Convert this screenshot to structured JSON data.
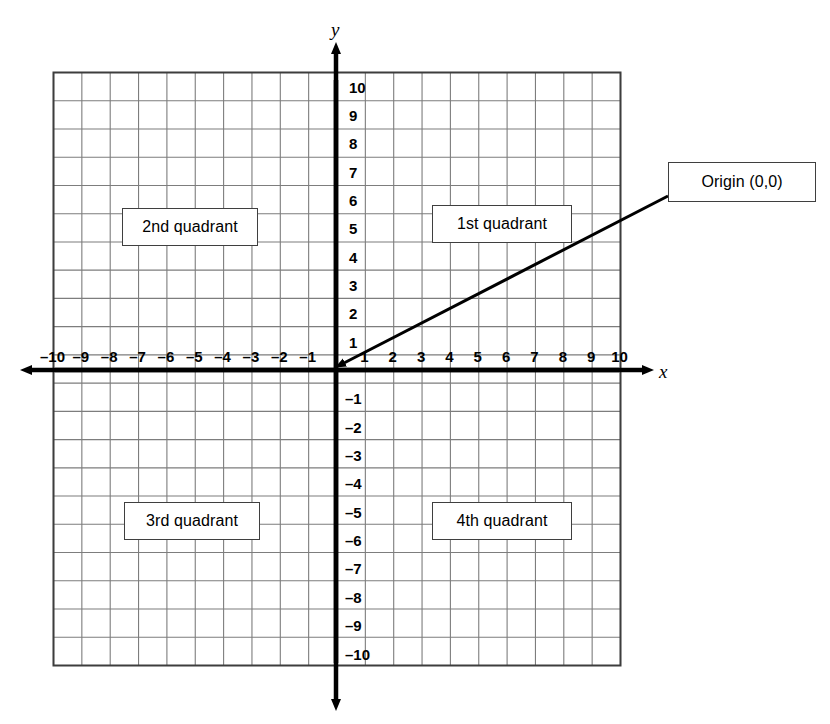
{
  "chart_data": {
    "type": "diagram",
    "xlabel": "x",
    "ylabel": "y",
    "xlim": [
      -10,
      10
    ],
    "ylim": [
      -10,
      10
    ],
    "grid": true,
    "grid_step": 1,
    "legend": "none",
    "x_ticks": [
      -10,
      -9,
      -8,
      -7,
      -6,
      -5,
      -4,
      -3,
      -2,
      -1,
      1,
      2,
      3,
      4,
      5,
      6,
      7,
      8,
      9,
      10
    ],
    "y_ticks": [
      10,
      9,
      8,
      7,
      6,
      5,
      4,
      3,
      2,
      1,
      -1,
      -2,
      -3,
      -4,
      -5,
      -6,
      -7,
      -8,
      -9,
      -10
    ],
    "x_tick_labels": [
      "–10",
      "–9",
      "–8",
      "–7",
      "–6",
      "–5",
      "–4",
      "–3",
      "–2",
      "–1",
      "1",
      "2",
      "3",
      "4",
      "5",
      "6",
      "7",
      "8",
      "9",
      "10"
    ],
    "y_tick_labels": [
      "10",
      "9",
      "8",
      "7",
      "6",
      "5",
      "4",
      "3",
      "2",
      "1",
      "–1",
      "–2",
      "–3",
      "–4",
      "–5",
      "–6",
      "–7",
      "–8",
      "–9",
      "–10"
    ],
    "annotations": [
      {
        "text": "2nd quadrant",
        "quadrant": 2,
        "at": [
          -6.5,
          4.8
        ]
      },
      {
        "text": "1st quadrant",
        "quadrant": 1,
        "at": [
          4.5,
          4.8
        ]
      },
      {
        "text": "3rd quadrant",
        "quadrant": 3,
        "at": [
          -6.5,
          -5.3
        ]
      },
      {
        "text": "4th quadrant",
        "quadrant": 4,
        "at": [
          4.5,
          -5.3
        ]
      },
      {
        "text": "Origin (0,0)",
        "points_to": [
          0,
          0
        ],
        "leader": true
      }
    ],
    "colors": {
      "axis": "#000000",
      "grid": "#7d7d7d",
      "grid_border": "#3d3d3d",
      "box_border": "#3f3f3f",
      "background": "#ffffff",
      "text": "#000000"
    }
  },
  "axes": {
    "x_letter": "x",
    "y_letter": "y"
  },
  "quadrants": {
    "first": "1st quadrant",
    "second": "2nd quadrant",
    "third": "3rd quadrant",
    "fourth": "4th quadrant"
  },
  "callout": {
    "origin_label": "Origin (0,0)"
  },
  "ticks": {
    "x_negative": [
      "–10",
      "–9",
      "–8",
      "–7",
      "–6",
      "–5",
      "–4",
      "–3",
      "–2",
      "–1"
    ],
    "x_positive": [
      "1",
      "2",
      "3",
      "4",
      "5",
      "6",
      "7",
      "8",
      "9",
      "10"
    ],
    "y_positive": [
      "10",
      "9",
      "8",
      "7",
      "6",
      "5",
      "4",
      "3",
      "2",
      "1"
    ],
    "y_negative": [
      "–1",
      "–2",
      "–3",
      "–4",
      "–5",
      "–6",
      "–7",
      "–8",
      "–9",
      "–10"
    ]
  }
}
